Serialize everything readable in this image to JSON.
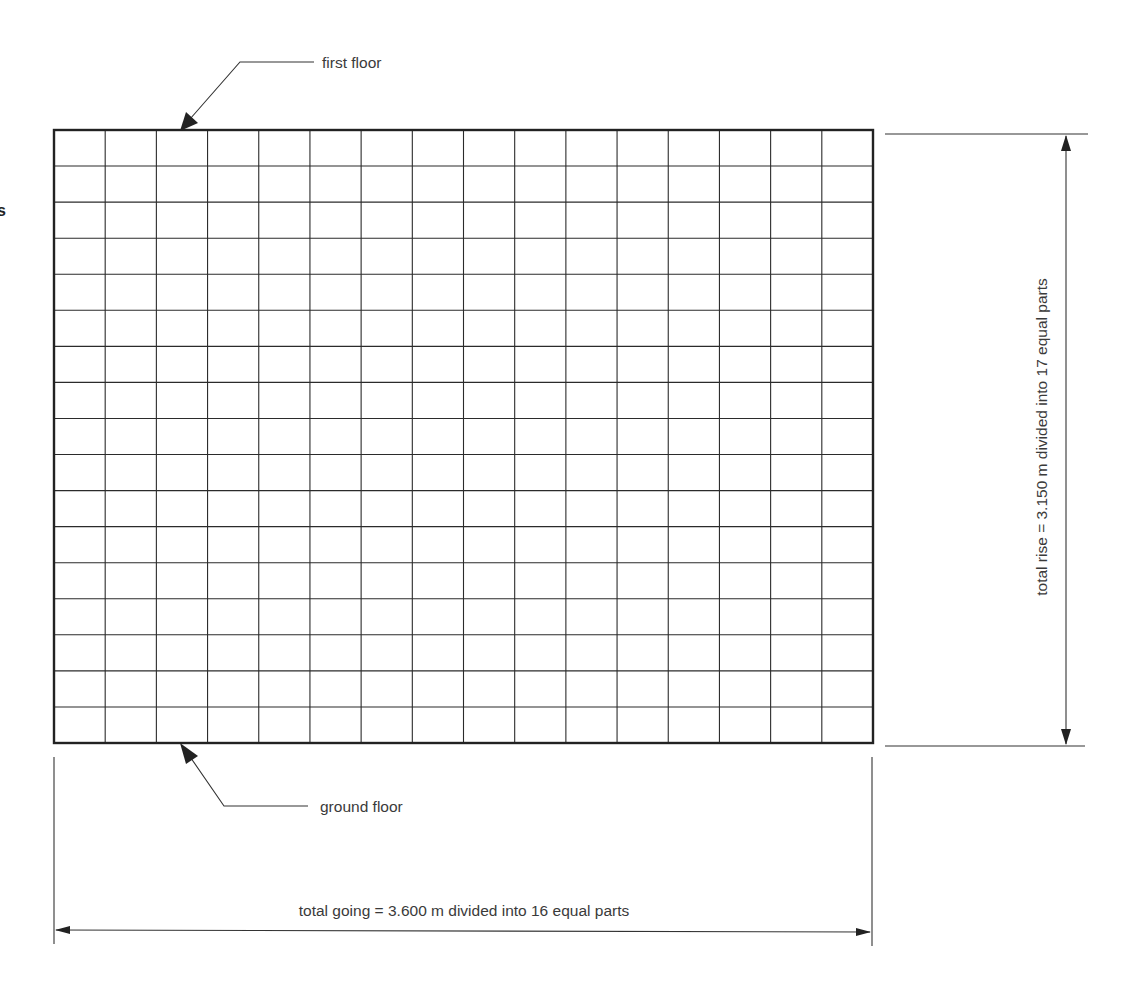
{
  "diagram": {
    "grid": {
      "going_parts": 16,
      "rise_parts": 17
    },
    "labels": {
      "first_floor": "first floor",
      "ground_floor": "ground floor",
      "total_rise": "total rise = 3.150 m divided into 17 equal parts",
      "total_going": "total going = 3.600 m divided into 16 equal parts"
    },
    "dimensions": {
      "total_rise_m": 3.15,
      "total_going_m": 3.6
    },
    "edge_fragment": "s"
  }
}
